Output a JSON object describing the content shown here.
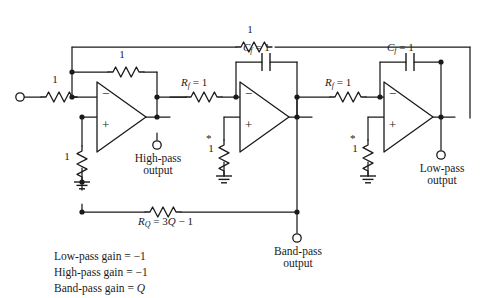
{
  "figure": {
    "background_color": "#ffffff",
    "line_color": "#1a1a1a"
  },
  "labels": {
    "input_resistor": "1",
    "feedback_resistor_1": "1",
    "top_feedback_resistor": "1",
    "inverting_ground_resistor": "1",
    "rf_1": {
      "symbol": "R",
      "sub": "f",
      "eq": " = 1"
    },
    "rf_2": {
      "symbol": "R",
      "sub": "f",
      "eq": " = 1"
    },
    "cf_1": {
      "symbol": "C",
      "sub": "f",
      "eq": " = 1"
    },
    "cf_2": {
      "symbol": "C",
      "sub": "f",
      "eq": " = 1"
    },
    "rq": {
      "symbol": "R",
      "sub": "Q",
      "eq": " = 3",
      "q": "Q",
      "tail": " − 1"
    },
    "star_resistor_mid": "1",
    "star_resistor_right": "1",
    "star_mark": "*"
  },
  "outputs": {
    "high_pass": {
      "line1": "High-pass",
      "line2": "output"
    },
    "band_pass": {
      "line1": "Band-pass",
      "line2": "output"
    },
    "low_pass": {
      "line1": "Low-pass",
      "line2": "output"
    }
  },
  "gain_notes": {
    "low_pass": {
      "prefix": "Low-pass gain = ",
      "value": "−1"
    },
    "high_pass": {
      "prefix": "High-pass gain = ",
      "value": "−1"
    },
    "band_pass": {
      "prefix": "Band-pass gain = ",
      "value": "Q"
    }
  },
  "opamps": {
    "amp1": {
      "minus": "−",
      "plus": "+"
    },
    "amp2": {
      "minus": "−",
      "plus": "+"
    },
    "amp3": {
      "minus": "−",
      "plus": "+"
    }
  }
}
